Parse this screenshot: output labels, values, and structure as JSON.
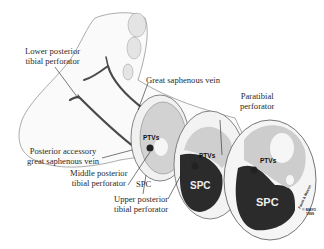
{
  "figure": {
    "type": "anatomical-illustration",
    "labels": {
      "lower_posterior_tibial_perforator": [
        "Lower posterior",
        "tibial perforator"
      ],
      "great_saphenous_vein": "Great saphenous vein",
      "paratibial_perforator": [
        "Paratibial",
        "perforator"
      ],
      "posterior_accessory_gsv": [
        "Posterior accessory",
        "great saphenous vein"
      ],
      "middle_posterior_tibial_perforator": [
        "Middle posterior",
        "tibial perforator"
      ],
      "spc_label": "SPC",
      "upper_posterior_tibial_perforator": [
        "Upper posterior",
        "tibial perforator"
      ]
    },
    "cross_sections": [
      {
        "name": "section-1",
        "ptvs": "PTVs"
      },
      {
        "name": "section-2",
        "ptvs": "PTVs",
        "spc": "SPC"
      },
      {
        "name": "section-3",
        "ptvs": "PTVs",
        "spc": "SPC"
      }
    ],
    "copyright": {
      "signature": "Faust & Mason",
      "mark": "© MAYO",
      "year": "1999"
    },
    "colors": {
      "vein": "#4a4a4a",
      "spc_fill": "#2b2b2b",
      "muscle": "#c9c9c9",
      "skin": "#f4f4f4",
      "outline": "#555555"
    }
  }
}
